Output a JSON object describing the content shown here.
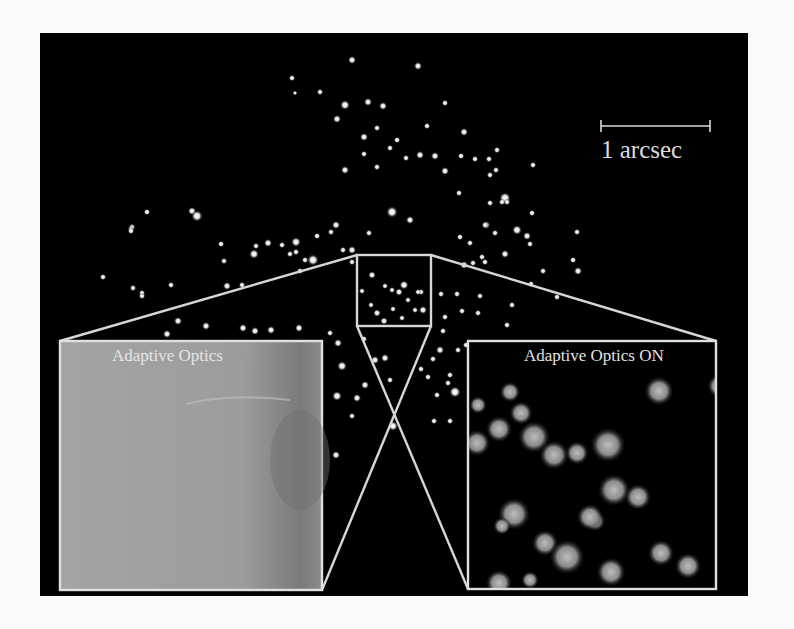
{
  "figure": {
    "background_color": "#000000",
    "page_color": "#fafafa",
    "line_color": "#d8d8d8"
  },
  "scale_bar": {
    "label": "1 arcsec",
    "x1": 601,
    "x2": 710,
    "y": 126
  },
  "zoom_box": {
    "x": 357,
    "y": 255,
    "w": 74,
    "h": 71
  },
  "insets": {
    "off": {
      "prefix": "Adaptive Optics ",
      "state": "OFF",
      "x": 60,
      "y": 341,
      "w": 262,
      "h": 249,
      "fill": "#9a9a9a"
    },
    "on": {
      "prefix": "Adaptive Optics ",
      "state": "ON",
      "x": 468,
      "y": 341,
      "w": 248,
      "h": 248,
      "fill": "#000000"
    }
  },
  "stars": [
    [
      352,
      60,
      2.5
    ],
    [
      292,
      78,
      2
    ],
    [
      418,
      66,
      2.5
    ],
    [
      320,
      92,
      2
    ],
    [
      295,
      93,
      1.5
    ],
    [
      383,
      106,
      2.5
    ],
    [
      345,
      105,
      3
    ],
    [
      368,
      102,
      2.5
    ],
    [
      445,
      103,
      2
    ],
    [
      464,
      132,
      2.5
    ],
    [
      377,
      128,
      2
    ],
    [
      427,
      126,
      2
    ],
    [
      337,
      119,
      2.5
    ],
    [
      420,
      155,
      2.5
    ],
    [
      364,
      137,
      2.5
    ],
    [
      445,
      171,
      2.5
    ],
    [
      475,
      159,
      2
    ],
    [
      435,
      156,
      2.5
    ],
    [
      397,
      140,
      2
    ],
    [
      364,
      154,
      2
    ],
    [
      390,
      148,
      2
    ],
    [
      406,
      158,
      2
    ],
    [
      377,
      167,
      2
    ],
    [
      345,
      170,
      2.5
    ],
    [
      392,
      212,
      3.5
    ],
    [
      505,
      198,
      3.5
    ],
    [
      461,
      156,
      2
    ],
    [
      497,
      150,
      2
    ],
    [
      489,
      159,
      2
    ],
    [
      490,
      175,
      2
    ],
    [
      459,
      193,
      2
    ],
    [
      496,
      170,
      2
    ],
    [
      490,
      203,
      2
    ],
    [
      507,
      202,
      2
    ],
    [
      533,
      165,
      2
    ],
    [
      502,
      202,
      2
    ],
    [
      410,
      220,
      2.5
    ],
    [
      486,
      225,
      2.5
    ],
    [
      460,
      237,
      2
    ],
    [
      485,
      225,
      2
    ],
    [
      527,
      236,
      2.5
    ],
    [
      517,
      230,
      3
    ],
    [
      532,
      213,
      2
    ],
    [
      470,
      243,
      2
    ],
    [
      482,
      257,
      2
    ],
    [
      495,
      233,
      2
    ],
    [
      530,
      244,
      2
    ],
    [
      505,
      254,
      2.5
    ],
    [
      192,
      211,
      2.5
    ],
    [
      147,
      212,
      2
    ],
    [
      132,
      227,
      2
    ],
    [
      197,
      216,
      3.5
    ],
    [
      131,
      229,
      2
    ],
    [
      221,
      244,
      2
    ],
    [
      256,
      246,
      2
    ],
    [
      268,
      243,
      2.5
    ],
    [
      282,
      245,
      2
    ],
    [
      296,
      252,
      2
    ],
    [
      227,
      286,
      2.5
    ],
    [
      254,
      254,
      3
    ],
    [
      103,
      277,
      2
    ],
    [
      290,
      254,
      2
    ],
    [
      313,
      260,
      3.5
    ],
    [
      296,
      242,
      3
    ],
    [
      331,
      232,
      2
    ],
    [
      343,
      250,
      2
    ],
    [
      352,
      250,
      2.5
    ],
    [
      224,
      261,
      2
    ],
    [
      133,
      288,
      2
    ],
    [
      142,
      293,
      2
    ],
    [
      142,
      296,
      2
    ],
    [
      171,
      285,
      2
    ],
    [
      131,
      231,
      2
    ],
    [
      242,
      285,
      2
    ],
    [
      369,
      233,
      2
    ],
    [
      336,
      225,
      2.5
    ],
    [
      317,
      236,
      2
    ],
    [
      300,
      271,
      2
    ],
    [
      305,
      260,
      2
    ],
    [
      352,
      262,
      2
    ],
    [
      421,
      292,
      2
    ],
    [
      441,
      294,
      2
    ],
    [
      423,
      310,
      2.5
    ],
    [
      445,
      317,
      2
    ],
    [
      464,
      265,
      2.5
    ],
    [
      485,
      262,
      2
    ],
    [
      543,
      271,
      2
    ],
    [
      578,
      271,
      2.5
    ],
    [
      573,
      260,
      2
    ],
    [
      577,
      232,
      2
    ],
    [
      557,
      297,
      2
    ],
    [
      531,
      284,
      2
    ],
    [
      473,
      263,
      2
    ],
    [
      457,
      294,
      2
    ],
    [
      480,
      296,
      2
    ],
    [
      462,
      311,
      2
    ],
    [
      443,
      331,
      2
    ],
    [
      507,
      325,
      2
    ],
    [
      478,
      313,
      2
    ],
    [
      512,
      305,
      2
    ],
    [
      206,
      326,
      2.5
    ],
    [
      178,
      321,
      2.5
    ],
    [
      167,
      334,
      2.5
    ],
    [
      243,
      328,
      2.5
    ],
    [
      255,
      331,
      2.5
    ],
    [
      271,
      330,
      2.5
    ],
    [
      299,
      328,
      2.5
    ],
    [
      330,
      333,
      2
    ],
    [
      338,
      343,
      2.5
    ],
    [
      364,
      339,
      2
    ],
    [
      342,
      366,
      3
    ],
    [
      375,
      360,
      2.5
    ],
    [
      385,
      358,
      2.5
    ],
    [
      337,
      396,
      3
    ],
    [
      357,
      398,
      2.5
    ],
    [
      365,
      385,
      2.5
    ],
    [
      390,
      380,
      2
    ],
    [
      393,
      426,
      3
    ],
    [
      352,
      416,
      2
    ],
    [
      336,
      455,
      2.5
    ],
    [
      440,
      350,
      2.5
    ],
    [
      448,
      383,
      2
    ],
    [
      437,
      395,
      2
    ],
    [
      455,
      392,
      3.5
    ],
    [
      421,
      369,
      2
    ],
    [
      433,
      359,
      2
    ],
    [
      428,
      377,
      2
    ],
    [
      466,
      345,
      2
    ],
    [
      458,
      350,
      2
    ],
    [
      450,
      375,
      2
    ],
    [
      434,
      421,
      2
    ],
    [
      450,
      421,
      2
    ]
  ],
  "box_stars": [
    [
      372,
      275,
      2.5
    ],
    [
      385,
      286,
      2
    ],
    [
      392,
      290,
      2
    ],
    [
      404,
      285,
      3
    ],
    [
      399,
      292,
      2.5
    ],
    [
      362,
      291,
      2
    ],
    [
      377,
      313,
      2.5
    ],
    [
      393,
      309,
      2
    ],
    [
      408,
      300,
      2
    ],
    [
      418,
      292,
      2
    ],
    [
      402,
      318,
      2
    ],
    [
      384,
      321,
      2.5
    ],
    [
      371,
      305,
      2
    ],
    [
      415,
      310,
      2
    ]
  ],
  "on_blobs": [
    [
      510,
      392,
      7
    ],
    [
      521,
      413,
      8
    ],
    [
      499,
      429,
      9
    ],
    [
      534,
      437,
      11
    ],
    [
      477,
      443,
      9
    ],
    [
      577,
      453,
      8
    ],
    [
      608,
      445,
      12
    ],
    [
      554,
      455,
      10
    ],
    [
      514,
      514,
      11
    ],
    [
      502,
      526,
      6
    ],
    [
      614,
      490,
      11
    ],
    [
      638,
      497,
      9
    ],
    [
      595,
      521,
      7
    ],
    [
      590,
      517,
      9
    ],
    [
      545,
      543,
      9
    ],
    [
      567,
      557,
      12
    ],
    [
      611,
      572,
      10
    ],
    [
      499,
      583,
      9
    ],
    [
      661,
      553,
      9
    ],
    [
      688,
      566,
      9
    ],
    [
      659,
      391,
      10
    ],
    [
      719,
      386,
      8
    ],
    [
      478,
      405,
      6
    ],
    [
      530,
      580,
      6
    ]
  ]
}
